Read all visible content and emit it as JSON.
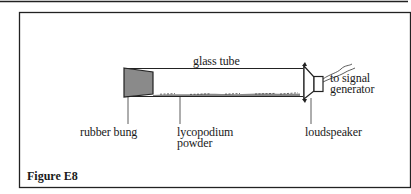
{
  "figure": {
    "caption": "Figure E8"
  },
  "labels": {
    "glass_tube": "glass tube",
    "signal_line1": "to signal",
    "signal_line2": "generator",
    "rubber_bung": "rubber bung",
    "powder_line1": "lycopodium",
    "powder_line2": "powder",
    "loudspeaker": "loudspeaker"
  },
  "colors": {
    "ink": "#1a1a1a",
    "bung_fill": "#8a8a8a",
    "background": "#ffffff"
  }
}
